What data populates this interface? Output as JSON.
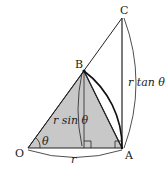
{
  "points": {
    "O": {
      "label": "O",
      "x": 28,
      "y": 148
    },
    "A": {
      "label": "A",
      "x": 122,
      "y": 148
    },
    "B": {
      "label": "B",
      "x": 84,
      "y": 71
    },
    "C": {
      "label": "C",
      "x": 122,
      "y": 18
    },
    "H": {
      "x": 84,
      "y": 148
    }
  },
  "labels": {
    "O": "O",
    "A": "A",
    "B": "B",
    "C": "C",
    "theta": "θ",
    "r": "r",
    "r_sin": "r sin θ",
    "r_tan": "r tan θ"
  },
  "colors": {
    "fill": "#c8c8c8",
    "stroke": "#222222"
  }
}
